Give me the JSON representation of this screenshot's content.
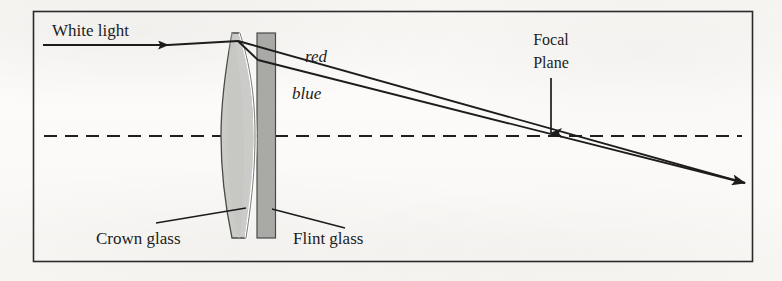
{
  "figure": {
    "type": "optical-ray-diagram",
    "frame": {
      "x": 33,
      "y": 11,
      "width": 720,
      "height": 251
    },
    "colors": {
      "ink": "#1c1c1c",
      "page": "#f8f7f4",
      "crown_glass_fill": "#cbcbc7",
      "flint_glass_fill": "#a9a9a5",
      "cement_gap": "#ffffff"
    },
    "labels": {
      "white_light": "White light",
      "red_ray": "red",
      "blue_ray": "blue",
      "focal_plane_line1": "Focal",
      "focal_plane_line2": "Plane",
      "crown_glass": "Crown glass",
      "flint_glass": "Flint glass"
    },
    "geometry": {
      "optical_axis_y": 136,
      "incoming_ray_y": 45,
      "incoming_ray_start_x": 43,
      "incoming_arrow_x": 168,
      "lens_entry_point": {
        "x": 237,
        "y": 40
      },
      "lens_left_x": 222,
      "lens_right_x": 275,
      "lens_top_y": 33,
      "lens_bottom_y": 238,
      "focus_point": {
        "x": 551,
        "y": 135
      },
      "ray_terminus": {
        "x": 745,
        "y": 183
      }
    }
  }
}
